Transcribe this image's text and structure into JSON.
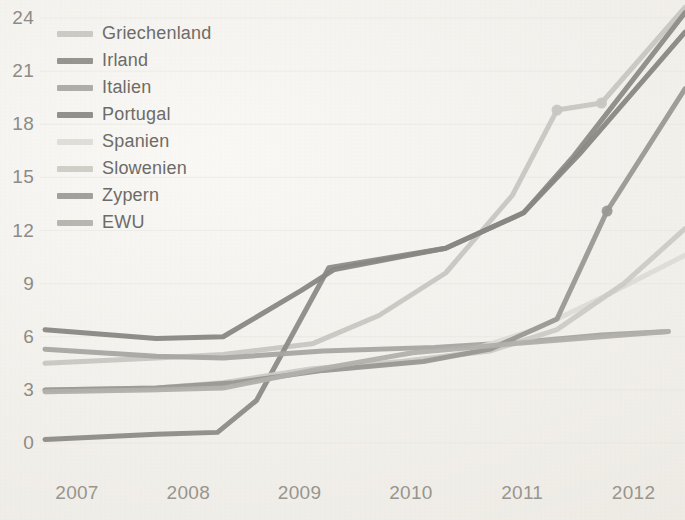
{
  "chart_data": {
    "type": "line",
    "title": "",
    "subtitle": "",
    "xlabel": "",
    "ylabel": "",
    "xlim": [
      2007,
      2012.75
    ],
    "ylim": [
      0,
      24
    ],
    "yticks": [
      0,
      3,
      6,
      9,
      12,
      15,
      18,
      21,
      24
    ],
    "xticks": [
      2007,
      2008,
      2009,
      2010,
      2011,
      2012
    ],
    "xtick_labels": [
      "2007",
      "2008",
      "2009",
      "2010",
      "2011",
      "2012"
    ],
    "ytick_labels": [
      "0",
      "3",
      "6",
      "9",
      "12",
      "15",
      "18",
      "21",
      "24"
    ],
    "grid": "faint-horizontal",
    "legend_position": "upper-left",
    "series": [
      {
        "name": "Griechenland",
        "color": "#c9c7c2",
        "width": 5,
        "markers": [
          {
            "x": 2011.6,
            "y": 18.8
          },
          {
            "x": 2012.0,
            "y": 19.2
          }
        ],
        "points": [
          {
            "x": 2007.0,
            "y": 4.5
          },
          {
            "x": 2008.0,
            "y": 4.8
          },
          {
            "x": 2008.6,
            "y": 5.0
          },
          {
            "x": 2009.4,
            "y": 5.6
          },
          {
            "x": 2010.0,
            "y": 7.2
          },
          {
            "x": 2010.6,
            "y": 9.6
          },
          {
            "x": 2011.2,
            "y": 14.0
          },
          {
            "x": 2011.6,
            "y": 18.8
          },
          {
            "x": 2012.0,
            "y": 19.2
          },
          {
            "x": 2012.75,
            "y": 24.6
          }
        ]
      },
      {
        "name": "Irland",
        "color": "#8e8c88",
        "width": 5,
        "markers": [],
        "points": [
          {
            "x": 2007.0,
            "y": 0.2
          },
          {
            "x": 2008.0,
            "y": 0.5
          },
          {
            "x": 2008.55,
            "y": 0.6
          },
          {
            "x": 2008.9,
            "y": 2.4
          },
          {
            "x": 2009.55,
            "y": 9.9
          },
          {
            "x": 2010.6,
            "y": 11.0
          },
          {
            "x": 2011.3,
            "y": 13.0
          },
          {
            "x": 2011.75,
            "y": 16.2
          },
          {
            "x": 2012.75,
            "y": 24.3
          }
        ]
      },
      {
        "name": "Italien",
        "color": "#a9a7a2",
        "width": 5,
        "markers": [],
        "points": [
          {
            "x": 2007.0,
            "y": 5.3
          },
          {
            "x": 2008.0,
            "y": 4.9
          },
          {
            "x": 2008.6,
            "y": 4.8
          },
          {
            "x": 2009.5,
            "y": 5.2
          },
          {
            "x": 2010.5,
            "y": 5.4
          },
          {
            "x": 2011.3,
            "y": 5.7
          },
          {
            "x": 2012.0,
            "y": 6.1
          },
          {
            "x": 2012.6,
            "y": 6.3
          }
        ]
      },
      {
        "name": "Portugal",
        "color": "#8a8884",
        "width": 5,
        "markers": [],
        "points": [
          {
            "x": 2007.0,
            "y": 6.4
          },
          {
            "x": 2008.0,
            "y": 5.9
          },
          {
            "x": 2008.6,
            "y": 6.0
          },
          {
            "x": 2009.3,
            "y": 8.6
          },
          {
            "x": 2009.6,
            "y": 9.8
          },
          {
            "x": 2010.6,
            "y": 11.0
          },
          {
            "x": 2011.3,
            "y": 13.0
          },
          {
            "x": 2011.8,
            "y": 16.3
          },
          {
            "x": 2012.75,
            "y": 23.2
          }
        ]
      },
      {
        "name": "Spanien",
        "color": "#dedcd7",
        "width": 5,
        "markers": [],
        "points": [
          {
            "x": 2007.0,
            "y": 2.9
          },
          {
            "x": 2008.0,
            "y": 3.0
          },
          {
            "x": 2008.6,
            "y": 3.2
          },
          {
            "x": 2009.3,
            "y": 4.0
          },
          {
            "x": 2010.0,
            "y": 4.4
          },
          {
            "x": 2010.7,
            "y": 5.0
          },
          {
            "x": 2011.4,
            "y": 6.4
          },
          {
            "x": 2012.0,
            "y": 8.2
          },
          {
            "x": 2012.75,
            "y": 10.6
          }
        ]
      },
      {
        "name": "Slowenien",
        "color": "#cecbc6",
        "width": 5,
        "markers": [],
        "points": [
          {
            "x": 2007.0,
            "y": 3.0
          },
          {
            "x": 2008.0,
            "y": 3.1
          },
          {
            "x": 2008.6,
            "y": 3.4
          },
          {
            "x": 2009.4,
            "y": 4.2
          },
          {
            "x": 2010.2,
            "y": 4.6
          },
          {
            "x": 2011.0,
            "y": 5.2
          },
          {
            "x": 2011.6,
            "y": 6.4
          },
          {
            "x": 2012.2,
            "y": 9.0
          },
          {
            "x": 2012.75,
            "y": 12.1
          }
        ]
      },
      {
        "name": "Zypern",
        "color": "#9b9994",
        "width": 5,
        "markers": [
          {
            "x": 2012.05,
            "y": 13.1
          }
        ],
        "points": [
          {
            "x": 2007.0,
            "y": 3.0
          },
          {
            "x": 2008.0,
            "y": 3.1
          },
          {
            "x": 2008.7,
            "y": 3.4
          },
          {
            "x": 2009.5,
            "y": 4.1
          },
          {
            "x": 2010.4,
            "y": 4.6
          },
          {
            "x": 2011.0,
            "y": 5.3
          },
          {
            "x": 2011.6,
            "y": 7.0
          },
          {
            "x": 2012.05,
            "y": 13.1
          },
          {
            "x": 2012.75,
            "y": 20.0
          }
        ]
      },
      {
        "name": "EWU",
        "color": "#b3b1ac",
        "width": 5,
        "markers": [],
        "points": [
          {
            "x": 2007.0,
            "y": 2.9
          },
          {
            "x": 2008.0,
            "y": 3.0
          },
          {
            "x": 2008.6,
            "y": 3.1
          },
          {
            "x": 2009.4,
            "y": 4.1
          },
          {
            "x": 2010.3,
            "y": 5.1
          },
          {
            "x": 2011.2,
            "y": 5.6
          },
          {
            "x": 2012.0,
            "y": 6.0
          },
          {
            "x": 2012.6,
            "y": 6.3
          }
        ]
      }
    ]
  },
  "legend": {
    "items": [
      {
        "label": "Griechenland",
        "color": "#c9c7c2"
      },
      {
        "label": "Irland",
        "color": "#8e8c88"
      },
      {
        "label": "Italien",
        "color": "#a9a7a2"
      },
      {
        "label": "Portugal",
        "color": "#8a8884"
      },
      {
        "label": "Spanien",
        "color": "#dedcd7"
      },
      {
        "label": "Slowenien",
        "color": "#cecbc6"
      },
      {
        "label": "Zypern",
        "color": "#9b9994"
      },
      {
        "label": "EWU",
        "color": "#b3b1ac"
      }
    ]
  },
  "axes": {
    "y_labels": [
      "24",
      "21",
      "18",
      "15",
      "12",
      "9",
      "6",
      "3",
      "0"
    ],
    "x_labels": [
      "2007",
      "2008",
      "2009",
      "2010",
      "2011",
      "2012"
    ]
  },
  "style": {
    "background": "#f4f2ee",
    "tick_color": "#8e8c88",
    "grid_color": "#e8e5df"
  }
}
